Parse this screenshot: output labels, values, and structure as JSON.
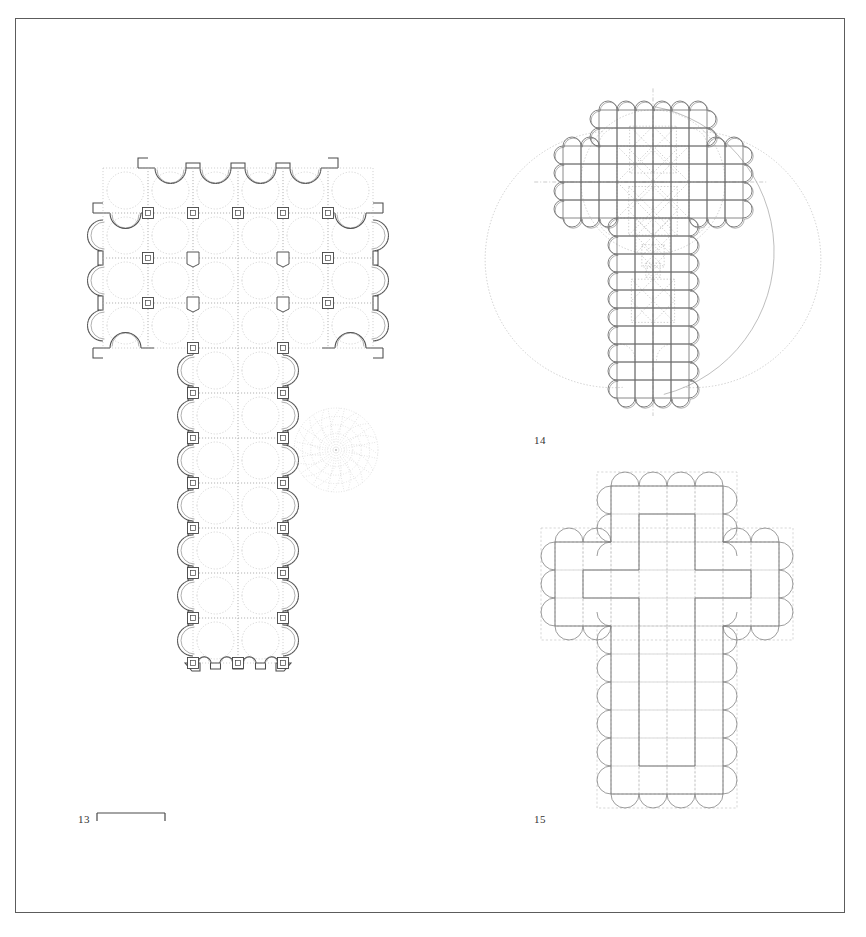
{
  "plate": {
    "background_color": "#ffffff",
    "frame_color": "#5c5c5c",
    "ink_color": "#4a4a4a",
    "construction_color": "#b4b4b4"
  },
  "figures": [
    {
      "id": "figure-13",
      "label": "13",
      "caption_number": "13",
      "kind": "floor-plan",
      "description": "Latin-cross church plan with scalloped chapel walls, piers and vault ribs",
      "label_x": 78,
      "label_y": 819,
      "has_scale_bar": true,
      "scale_bar": {
        "x": 97,
        "y": 815,
        "width": 70,
        "tick_height": 7
      },
      "plan": {
        "module": 45,
        "pier_size": 11,
        "pier_inner_size": 5,
        "crossing_rose": {
          "cx": 281,
          "cy": 330,
          "r": 42,
          "spokes": 16,
          "rings": 5
        },
        "lobes_top": 4,
        "lobes_bottom": 4,
        "lobes_transept_each_side": 4,
        "lobes_nave_each_side": 7,
        "chapel_radius": 22
      }
    },
    {
      "id": "figure-14",
      "label": "14",
      "caption_number": "14",
      "kind": "geometric-analysis",
      "description": "Proportional analysis of the plan: orthogonal grid, lobed perimeter, inscribed circles and rotated squares",
      "label_x": 534,
      "label_y": 440,
      "grid_module": 18,
      "lobe_radius": 9,
      "axes": {
        "vertical": true,
        "horizontal": true
      },
      "construction": {
        "rotated_squares": 5,
        "large_arcs": 3,
        "inscribed_circle": true
      }
    },
    {
      "id": "figure-15",
      "label": "15",
      "caption_number": "15",
      "kind": "schematic-diagram",
      "description": "Schematic cross plan on a dotted module grid with semicircular chapels and inner cross outline",
      "label_x": 534,
      "label_y": 819,
      "grid_module": 28,
      "lobe_radius": 14,
      "nave_lobes_per_side": 8,
      "transept_lobes_per_side": 4,
      "head_lobes": 4,
      "foot_lobes": 4
    }
  ]
}
